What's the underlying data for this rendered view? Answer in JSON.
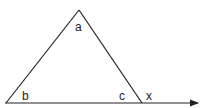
{
  "diagram": {
    "type": "triangle-exterior-angle",
    "labels": {
      "apex": "a",
      "bottom_left": "b",
      "bottom_right": "c",
      "exterior": "x"
    },
    "line_color": "#222222"
  }
}
